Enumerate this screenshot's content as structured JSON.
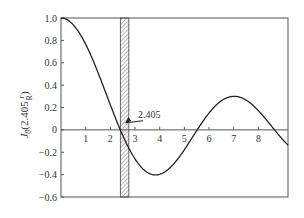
{
  "chart_data": {
    "type": "line",
    "title": "",
    "xlabel": "",
    "ylabel": "J0(2.405 r/R)",
    "ylabel_parts": {
      "main": "J",
      "sub": "0",
      "arg_prefix": "(2.405 ",
      "frac_num": "r",
      "frac_den": "R",
      "arg_suffix": ")"
    },
    "xlim": [
      0,
      9.2
    ],
    "ylim": [
      -0.6,
      1.0
    ],
    "x_ticks": [
      1,
      2,
      3,
      4,
      5,
      6,
      7,
      8
    ],
    "x_tick_labels": [
      "1",
      "2",
      "3",
      "4",
      "5",
      "6",
      "7",
      "8"
    ],
    "y_ticks": [
      1.0,
      0.8,
      0.6,
      0.4,
      0.2,
      0,
      -0.2,
      -0.4,
      -0.6
    ],
    "y_tick_labels": [
      "1.0",
      "0.8",
      "0.6",
      "0.4",
      "0.2",
      "0",
      "-0.2",
      "-0.4",
      "-0.6"
    ],
    "grid": false,
    "series": [
      {
        "name": "J0(x)",
        "x": [
          0,
          0.5,
          1.0,
          1.5,
          2.0,
          2.405,
          3.0,
          3.5,
          3.832,
          4.5,
          5.0,
          5.52,
          6.0,
          6.5,
          7.016,
          7.5,
          8.0,
          8.654,
          9.2
        ],
        "y": [
          1.0,
          0.938,
          0.765,
          0.512,
          0.224,
          0.0,
          -0.26,
          -0.38,
          -0.403,
          -0.321,
          -0.178,
          0.0,
          0.151,
          0.26,
          0.3,
          0.266,
          0.172,
          0.0,
          -0.15
        ]
      }
    ],
    "annotations": [
      {
        "text": "2.405",
        "x": 2.405,
        "y": 0,
        "type": "arrow",
        "label_pos": [
          3.0,
          0.1
        ]
      },
      {
        "type": "hatched_band",
        "x_range": [
          2.405,
          2.75
        ],
        "description": "hatched vertical strip at first zero"
      }
    ]
  }
}
